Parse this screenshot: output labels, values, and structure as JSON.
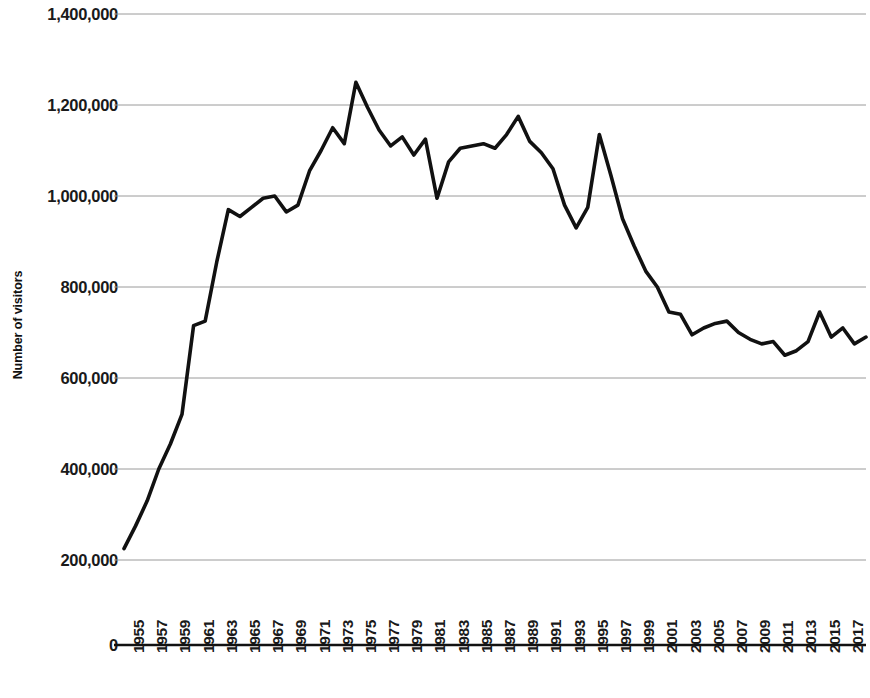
{
  "chart_data": {
    "type": "line",
    "title": "",
    "xlabel": "",
    "ylabel": "Number of visitors",
    "ylim": [
      0,
      1400000
    ],
    "y_ticks": [
      0,
      200000,
      400000,
      600000,
      800000,
      1000000,
      1200000,
      1400000
    ],
    "y_tick_labels": [
      "0",
      "200,000",
      "400,000",
      "600,000",
      "800,000",
      "1,000,000",
      "1,200,000",
      "1,400,000"
    ],
    "grid": "horizontal",
    "legend": "none",
    "line_color": "#111111",
    "x_tick_labels": [
      "1955",
      "1957",
      "1959",
      "1961",
      "1963",
      "1965",
      "1967",
      "1969",
      "1971",
      "1973",
      "1975",
      "1977",
      "1979",
      "1981",
      "1983",
      "1985",
      "1987",
      "1989",
      "1991",
      "1993",
      "1995",
      "1997",
      "1999",
      "2001",
      "2003",
      "2005",
      "2007",
      "2009",
      "2011",
      "2013",
      "2015",
      "2017",
      "2019"
    ],
    "x": [
      1955,
      1956,
      1957,
      1958,
      1959,
      1960,
      1961,
      1962,
      1963,
      1964,
      1965,
      1966,
      1967,
      1968,
      1969,
      1970,
      1971,
      1972,
      1973,
      1974,
      1975,
      1976,
      1977,
      1978,
      1979,
      1980,
      1981,
      1982,
      1983,
      1984,
      1985,
      1986,
      1987,
      1988,
      1989,
      1990,
      1991,
      1992,
      1993,
      1994,
      1995,
      1996,
      1997,
      1998,
      1999,
      2000,
      2001,
      2002,
      2003,
      2004,
      2005,
      2006,
      2007,
      2008,
      2009,
      2010,
      2011,
      2012,
      2013,
      2014,
      2015,
      2016,
      2017,
      2018,
      2019
    ],
    "values": [
      225000,
      275000,
      330000,
      400000,
      455000,
      520000,
      715000,
      725000,
      855000,
      970000,
      955000,
      975000,
      995000,
      1000000,
      965000,
      980000,
      1055000,
      1100000,
      1150000,
      1115000,
      1250000,
      1195000,
      1145000,
      1110000,
      1130000,
      1090000,
      1125000,
      995000,
      1075000,
      1105000,
      1110000,
      1115000,
      1105000,
      1135000,
      1175000,
      1120000,
      1095000,
      1060000,
      980000,
      930000,
      975000,
      1135000,
      1045000,
      950000,
      890000,
      835000,
      800000,
      745000,
      740000,
      695000,
      710000,
      720000,
      725000,
      700000,
      685000,
      675000,
      680000,
      650000,
      660000,
      680000,
      745000,
      690000,
      710000,
      675000,
      690000
    ]
  }
}
